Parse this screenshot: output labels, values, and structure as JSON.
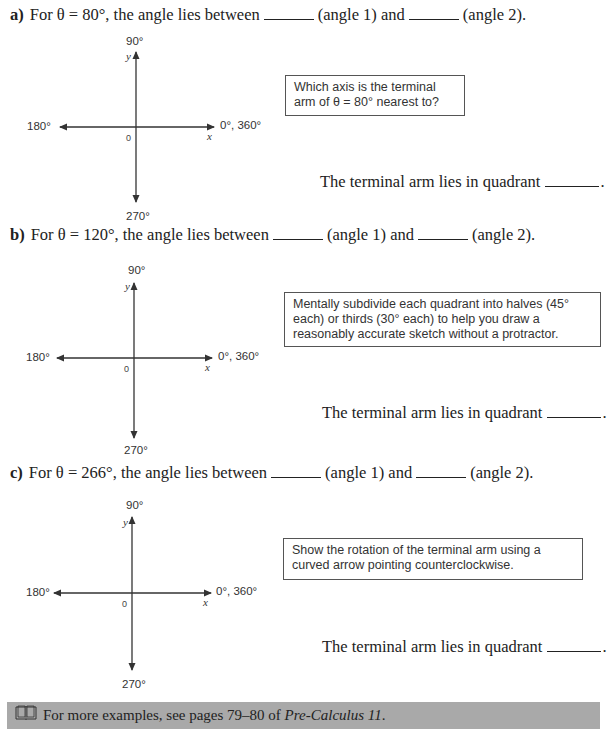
{
  "parts": [
    {
      "label": "a)",
      "prefix": "For θ = 80°, the angle lies between",
      "angle1": "(angle 1) and",
      "angle2": "(angle 2).",
      "hint": "Which axis is the terminal arm of θ = 80° nearest to?",
      "answer": "The terminal arm lies in quadrant",
      "axes": {
        "top": "90°",
        "left": "180°",
        "right": "0°, 360°",
        "bottom": "270°",
        "x": "x",
        "y": "y",
        "origin": "0"
      }
    },
    {
      "label": "b)",
      "prefix": "For θ = 120°, the angle lies between",
      "angle1": "(angle 1) and",
      "angle2": "(angle 2).",
      "hint": "Mentally subdivide each quadrant into halves (45° each) or thirds (30° each) to help you draw a reasonably accurate sketch without a protractor.",
      "answer": "The terminal arm lies in quadrant",
      "axes": {
        "top": "90°",
        "left": "180°",
        "right": "0°, 360°",
        "bottom": "270°",
        "x": "x",
        "y": "y",
        "origin": "0"
      }
    },
    {
      "label": "c)",
      "prefix": "For θ = 266°, the angle lies between",
      "angle1": "(angle 1) and",
      "angle2": "(angle 2).",
      "hint": "Show the rotation of the terminal arm using a curved arrow pointing counterclockwise.",
      "answer": "The terminal arm lies in quadrant",
      "axes": {
        "top": "90°",
        "left": "180°",
        "right": "0°, 360°",
        "bottom": "270°",
        "x": "x",
        "y": "y",
        "origin": "0"
      }
    }
  ],
  "reference": {
    "icon": "book-icon",
    "text": "For more examples, see pages 79–80 of",
    "book_title": "Pre-Calculus 11",
    "end": ".",
    "bar_color": "#a9a9a9"
  }
}
